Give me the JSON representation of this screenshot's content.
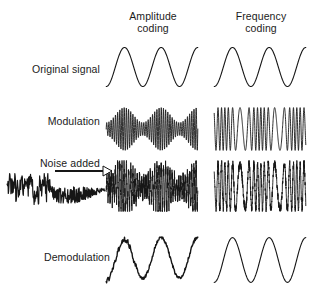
{
  "figure": {
    "background_color": "#ffffff",
    "stroke_color": "#161616",
    "text_color": "#1b1b1b"
  },
  "columns": [
    {
      "id": "amplitude",
      "line1": "Amplitude",
      "line2": "coding"
    },
    {
      "id": "frequency",
      "line1": "Frequency",
      "line2": "coding"
    }
  ],
  "rows": [
    {
      "id": "original",
      "label": "Original signal"
    },
    {
      "id": "modulation",
      "label": "Modulation"
    },
    {
      "id": "noise",
      "label": "Noise added"
    },
    {
      "id": "demodulation",
      "label": "Demodulation"
    }
  ],
  "annotations": {
    "noise_arrow": "arrow-right-icon",
    "noise_trace": "noise-waveform"
  },
  "chart_data": {
    "type": "line",
    "title": "",
    "xlabel": "",
    "ylabel": "",
    "grid": false,
    "legend": "none",
    "panels": [
      {
        "row": "Original signal",
        "column": "Amplitude coding",
        "waveform": "sine",
        "cycles": 2.5,
        "amplitude": 1.0,
        "carrier": false,
        "noise": 0.0
      },
      {
        "row": "Original signal",
        "column": "Frequency coding",
        "waveform": "sine",
        "cycles": 2.5,
        "amplitude": 1.0,
        "carrier": false,
        "noise": 0.0
      },
      {
        "row": "Modulation",
        "column": "Amplitude coding",
        "waveform": "amplitude-modulated-carrier",
        "cycles": 2.5,
        "carrier_cycles": 40,
        "amplitude": 1.0,
        "noise": 0.0
      },
      {
        "row": "Modulation",
        "column": "Frequency coding",
        "waveform": "frequency-modulated-carrier",
        "cycles": 2.5,
        "carrier_cycles": 18,
        "amplitude": 1.0,
        "noise": 0.0
      },
      {
        "row": "Noise added",
        "column": "Amplitude coding",
        "waveform": "amplitude-modulated-carrier",
        "cycles": 2.5,
        "carrier_cycles": 40,
        "amplitude": 1.0,
        "noise": 0.45
      },
      {
        "row": "Noise added",
        "column": "Frequency coding",
        "waveform": "frequency-modulated-carrier",
        "cycles": 2.5,
        "carrier_cycles": 18,
        "amplitude": 1.0,
        "noise": 0.45
      },
      {
        "row": "Demodulation",
        "column": "Amplitude coding",
        "waveform": "sine",
        "cycles": 2.5,
        "amplitude": 1.0,
        "carrier": false,
        "noise": 0.18
      },
      {
        "row": "Demodulation",
        "column": "Frequency coding",
        "waveform": "sine",
        "cycles": 2.5,
        "amplitude": 1.0,
        "carrier": false,
        "noise": 0.0
      }
    ],
    "noise_source": {
      "label": "Noise added",
      "waveform": "random-noise",
      "amplitude": 0.35
    }
  }
}
